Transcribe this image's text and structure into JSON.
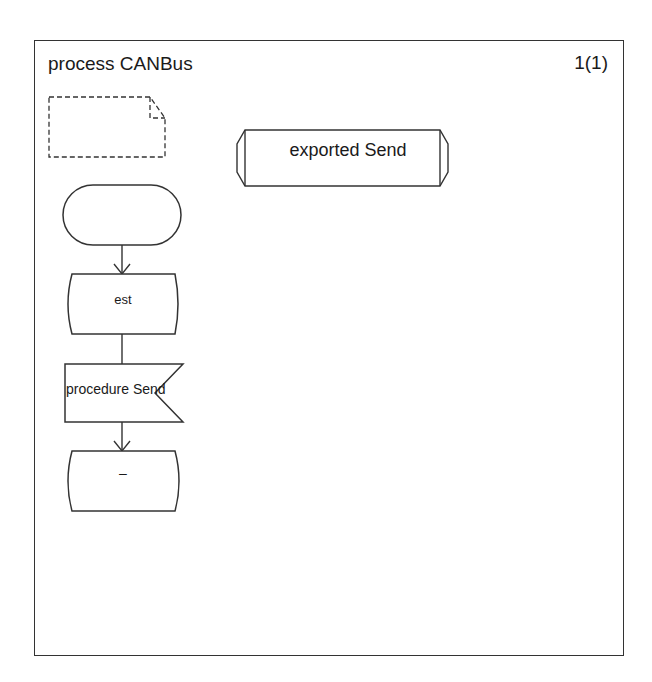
{
  "diagram": {
    "title": "process CANBus",
    "page_indicator": "1(1)",
    "text_symbol": {
      "label": ""
    },
    "procedure_reference": {
      "label": "exported Send"
    },
    "flow": {
      "start": {
        "label": ""
      },
      "state": {
        "label": "est"
      },
      "input": {
        "label": "procedure Send"
      },
      "nextstate": {
        "label": "–"
      }
    },
    "colors": {
      "line": "#333333",
      "background": "#ffffff",
      "text": "#1a1a1a"
    }
  }
}
